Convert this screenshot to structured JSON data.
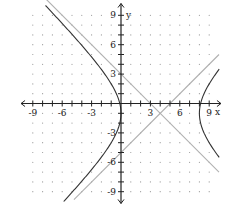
{
  "chart_data": {
    "type": "line",
    "title": "",
    "xlabel": "x",
    "ylabel": "y",
    "xlim": [
      -9.5,
      9.5
    ],
    "ylim": [
      -9.5,
      9.5
    ],
    "grid": "dots",
    "x_ticks": [
      -9,
      -6,
      -3,
      3,
      6,
      9
    ],
    "y_ticks": [
      9,
      6,
      3,
      -3,
      -6,
      -9
    ],
    "x_tick_labels": [
      "-9",
      "-6",
      "-3",
      "3",
      "6",
      "9"
    ],
    "y_tick_labels": [
      "9",
      "6",
      "3",
      "-3",
      "-6",
      "-9"
    ],
    "series": [
      {
        "name": "hyperbola",
        "equation": "(x-4)^2/16 - (y+1)^2/16 = 1",
        "center": [
          4,
          -1
        ],
        "vertices": [
          [
            0,
            -1
          ],
          [
            8,
            -1
          ]
        ],
        "color": "#333333"
      },
      {
        "name": "asymptote-descending",
        "equation": "y = -x + 3",
        "color": "#b0b0b0"
      },
      {
        "name": "asymptote-ascending",
        "equation": "y = x - 5",
        "color": "#b0b0b0"
      }
    ]
  },
  "axes": {
    "x_label": "x",
    "y_label": "y"
  },
  "colors": {
    "curve": "#333333",
    "asymptote": "#b0b0b0",
    "axis": "#222222",
    "grid_dot": "#9a9a9a"
  }
}
